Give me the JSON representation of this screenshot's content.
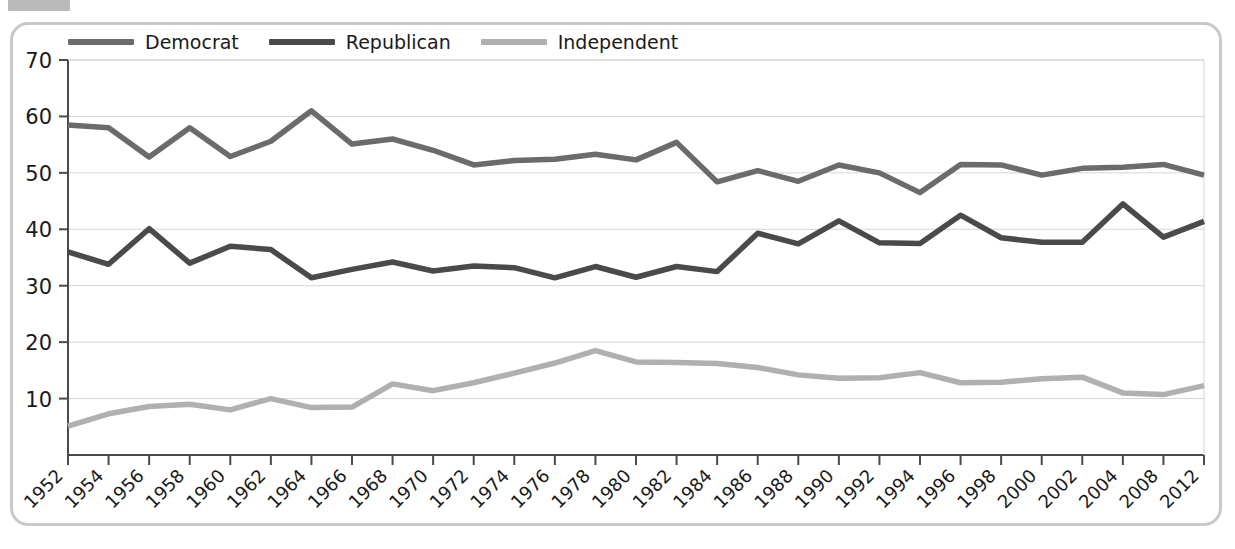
{
  "figure": {
    "frame_border_color": "#c9c9c9",
    "background": "#ffffff",
    "top_tab_color": "#b9b9b9"
  },
  "legend": {
    "position": "top-left",
    "items": [
      {
        "label": "Democrat",
        "color": "#6b6b6b",
        "swatch_name": "legend-swatch-democrat"
      },
      {
        "label": "Republican",
        "color": "#4a4a4a",
        "swatch_name": "legend-swatch-republican"
      },
      {
        "label": "Independent",
        "color": "#b0b0b0",
        "swatch_name": "legend-swatch-independent"
      }
    ]
  },
  "axes": {
    "y_ticks": [
      "70",
      "60",
      "50",
      "40",
      "30",
      "20",
      "10"
    ],
    "x_ticks": [
      "1952",
      "1954",
      "1956",
      "1958",
      "1960",
      "1962",
      "1964",
      "1966",
      "1968",
      "1970",
      "1972",
      "1974",
      "1976",
      "1978",
      "1980",
      "1982",
      "1984",
      "1986",
      "1988",
      "1990",
      "1992",
      "1994",
      "1996",
      "1998",
      "2000",
      "2002",
      "2004",
      "2008",
      "2012"
    ],
    "y_min": 0,
    "y_max": 70,
    "y_step": 10,
    "x_label_rotation_deg": -45
  },
  "chart_data": {
    "type": "line",
    "title": "",
    "subtitle": "",
    "xlabel": "",
    "ylabel": "",
    "ylim": [
      0,
      70
    ],
    "grid": true,
    "legend_position": "top-left",
    "categories": [
      "1952",
      "1954",
      "1956",
      "1958",
      "1960",
      "1962",
      "1964",
      "1966",
      "1968",
      "1970",
      "1972",
      "1974",
      "1976",
      "1978",
      "1980",
      "1982",
      "1984",
      "1986",
      "1988",
      "1990",
      "1992",
      "1994",
      "1996",
      "1998",
      "2000",
      "2002",
      "2004",
      "2008",
      "2012"
    ],
    "series": [
      {
        "name": "Democrat",
        "color": "#6b6b6b",
        "values": [
          58.5,
          58.0,
          52.8,
          58.0,
          52.9,
          55.6,
          61.0,
          55.1,
          56.0,
          54.0,
          51.4,
          52.2,
          52.4,
          53.3,
          52.3,
          55.4,
          48.4,
          50.4,
          48.5,
          51.4,
          50.0,
          46.5,
          51.5,
          51.4,
          49.6,
          50.8,
          51.0,
          51.5,
          49.6
        ]
      },
      {
        "name": "Republican",
        "color": "#4a4a4a",
        "values": [
          36.0,
          33.8,
          40.1,
          34.0,
          37.0,
          36.4,
          31.4,
          32.9,
          34.2,
          32.6,
          33.5,
          33.2,
          31.4,
          33.4,
          31.5,
          33.4,
          32.5,
          39.3,
          37.4,
          41.5,
          37.6,
          37.5,
          42.5,
          38.5,
          37.7,
          37.7,
          44.5,
          38.6,
          41.4
        ]
      },
      {
        "name": "Independent",
        "color": "#b0b0b0",
        "values": [
          5.1,
          7.3,
          8.6,
          9.0,
          8.0,
          10.0,
          8.4,
          8.5,
          12.6,
          11.4,
          12.8,
          14.5,
          16.3,
          18.5,
          16.5,
          16.4,
          16.2,
          15.5,
          14.2,
          13.6,
          13.7,
          14.6,
          12.8,
          12.9,
          13.5,
          13.8,
          11.0,
          10.7,
          12.3
        ]
      }
    ]
  }
}
